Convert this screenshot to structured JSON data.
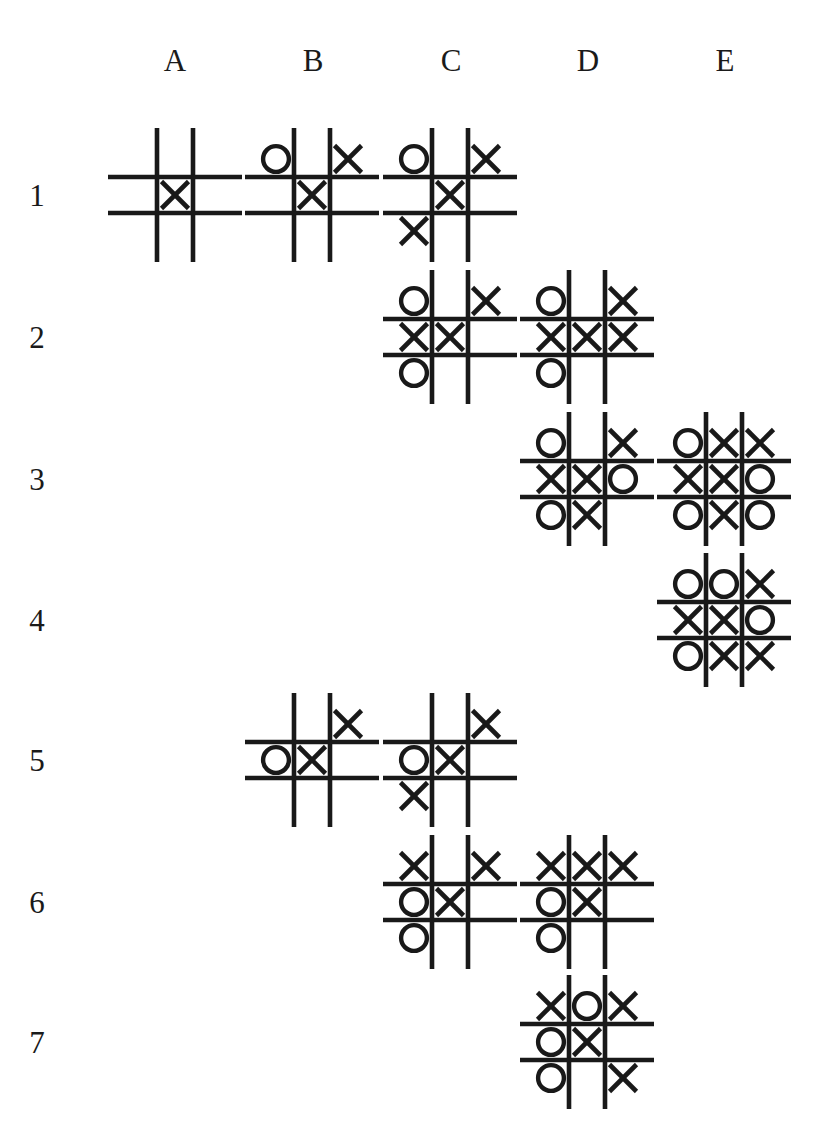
{
  "figure": {
    "title_fragment": "",
    "columns": [
      "A",
      "B",
      "C",
      "D",
      "E"
    ],
    "rows": [
      "1",
      "2",
      "3",
      "4",
      "5",
      "6",
      "7"
    ],
    "mark_empty": "",
    "mark_x": "X",
    "mark_o": "O",
    "ink_color": "#191919",
    "background_color": "#ffffff"
  },
  "chart_data": {
    "type": "table",
    "xlabel": "Column",
    "ylabel": "Row",
    "categories": [
      "A",
      "B",
      "C",
      "D",
      "E"
    ],
    "row_categories": [
      "1",
      "2",
      "3",
      "4",
      "5",
      "6",
      "7"
    ],
    "cell_notation": "3x3 board rows top-to-bottom; 'X', 'O', or '' for empty",
    "boards": [
      {
        "id": "A1",
        "col": "A",
        "row": "1",
        "x": 121,
        "y": 141,
        "cells": [
          [
            "",
            "",
            ""
          ],
          [
            "",
            "X",
            ""
          ],
          [
            "",
            "",
            ""
          ]
        ]
      },
      {
        "id": "B1",
        "col": "B",
        "row": "1",
        "x": 258,
        "y": 141,
        "cells": [
          [
            "O",
            "",
            "X"
          ],
          [
            "",
            "X",
            ""
          ],
          [
            "",
            "",
            ""
          ]
        ]
      },
      {
        "id": "C1",
        "col": "C",
        "row": "1",
        "x": 396,
        "y": 141,
        "cells": [
          [
            "O",
            "",
            "X"
          ],
          [
            "",
            "X",
            ""
          ],
          [
            "X",
            "",
            ""
          ]
        ]
      },
      {
        "id": "C2",
        "col": "C",
        "row": "2",
        "x": 396,
        "y": 283,
        "cells": [
          [
            "O",
            "",
            "X"
          ],
          [
            "X",
            "X",
            ""
          ],
          [
            "O",
            "",
            ""
          ]
        ]
      },
      {
        "id": "D2",
        "col": "D",
        "row": "2",
        "x": 533,
        "y": 283,
        "cells": [
          [
            "O",
            "",
            "X"
          ],
          [
            "X",
            "X",
            "X"
          ],
          [
            "O",
            "",
            ""
          ]
        ]
      },
      {
        "id": "D3",
        "col": "D",
        "row": "3",
        "x": 533,
        "y": 425,
        "cells": [
          [
            "O",
            "",
            "X"
          ],
          [
            "X",
            "X",
            "O"
          ],
          [
            "O",
            "X",
            ""
          ]
        ]
      },
      {
        "id": "E3",
        "col": "E",
        "row": "3",
        "x": 670,
        "y": 425,
        "cells": [
          [
            "O",
            "X",
            "X"
          ],
          [
            "X",
            "X",
            "O"
          ],
          [
            "O",
            "X",
            "O"
          ]
        ]
      },
      {
        "id": "E4",
        "col": "E",
        "row": "4",
        "x": 670,
        "y": 566,
        "cells": [
          [
            "O",
            "O",
            "X"
          ],
          [
            "X",
            "X",
            "O"
          ],
          [
            "O",
            "X",
            "X"
          ]
        ]
      },
      {
        "id": "B5",
        "col": "B",
        "row": "5",
        "x": 258,
        "y": 706,
        "cells": [
          [
            "",
            "",
            "X"
          ],
          [
            "O",
            "X",
            ""
          ],
          [
            "",
            "",
            ""
          ]
        ]
      },
      {
        "id": "C5",
        "col": "C",
        "row": "5",
        "x": 396,
        "y": 706,
        "cells": [
          [
            "",
            "",
            "X"
          ],
          [
            "O",
            "X",
            ""
          ],
          [
            "X",
            "",
            ""
          ]
        ]
      },
      {
        "id": "C6",
        "col": "C",
        "row": "6",
        "x": 396,
        "y": 848,
        "cells": [
          [
            "X",
            "",
            "X"
          ],
          [
            "O",
            "X",
            ""
          ],
          [
            "O",
            "",
            ""
          ]
        ]
      },
      {
        "id": "D6",
        "col": "D",
        "row": "6",
        "x": 533,
        "y": 848,
        "cells": [
          [
            "X",
            "X",
            "X"
          ],
          [
            "O",
            "X",
            ""
          ],
          [
            "O",
            "",
            ""
          ]
        ]
      },
      {
        "id": "D7",
        "col": "D",
        "row": "7",
        "x": 533,
        "y": 988,
        "cells": [
          [
            "X",
            "O",
            "X"
          ],
          [
            "O",
            "X",
            ""
          ],
          [
            "O",
            "",
            "X"
          ]
        ]
      }
    ],
    "column_positions": [
      175,
      313,
      451,
      588,
      725
    ],
    "row_positions": [
      196,
      338,
      480,
      621,
      761,
      903,
      1043
    ]
  }
}
